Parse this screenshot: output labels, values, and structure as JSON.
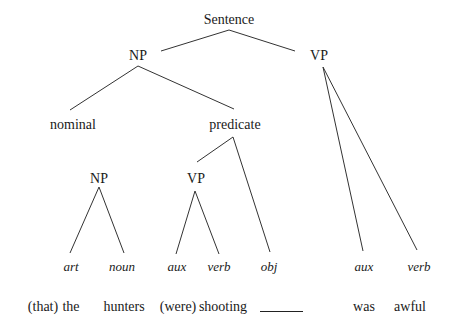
{
  "diagram": {
    "type": "syntax-tree",
    "root": {
      "label": "Sentence",
      "x": 229,
      "y": 12
    },
    "nodes": [
      {
        "id": "s",
        "label": "Sentence",
        "x": 229,
        "y": 12,
        "italic": false
      },
      {
        "id": "np1",
        "label": "NP",
        "x": 138,
        "y": 48,
        "italic": false
      },
      {
        "id": "vp1",
        "label": "VP",
        "x": 319,
        "y": 48,
        "italic": false
      },
      {
        "id": "nominal",
        "label": "nominal",
        "x": 73,
        "y": 117,
        "italic": false
      },
      {
        "id": "predicate",
        "label": "predicate",
        "x": 235,
        "y": 117,
        "italic": false
      },
      {
        "id": "np2",
        "label": "NP",
        "x": 99,
        "y": 171,
        "italic": false
      },
      {
        "id": "vp2",
        "label": "VP",
        "x": 196,
        "y": 171,
        "italic": false
      },
      {
        "id": "art",
        "label": "art",
        "x": 71,
        "y": 259,
        "italic": true
      },
      {
        "id": "noun",
        "label": "noun",
        "x": 122,
        "y": 259,
        "italic": true
      },
      {
        "id": "aux1",
        "label": "aux",
        "x": 177,
        "y": 259,
        "italic": true
      },
      {
        "id": "verb1",
        "label": "verb",
        "x": 219,
        "y": 259,
        "italic": true
      },
      {
        "id": "obj",
        "label": "obj",
        "x": 269,
        "y": 259,
        "italic": true
      },
      {
        "id": "aux2",
        "label": "aux",
        "x": 364,
        "y": 259,
        "italic": true
      },
      {
        "id": "verb2",
        "label": "verb",
        "x": 419,
        "y": 259,
        "italic": true
      }
    ],
    "edges": [
      {
        "from": "s",
        "to": "np1",
        "x1": 229,
        "y1": 30,
        "x2": 161,
        "y2": 51
      },
      {
        "from": "s",
        "to": "vp1",
        "x1": 229,
        "y1": 30,
        "x2": 295,
        "y2": 51
      },
      {
        "from": "np1",
        "to": "nominal",
        "x1": 138,
        "y1": 66,
        "x2": 70,
        "y2": 110
      },
      {
        "from": "np1",
        "to": "predicate",
        "x1": 138,
        "y1": 66,
        "x2": 234,
        "y2": 109
      },
      {
        "from": "vp1",
        "to": "aux2",
        "x1": 323,
        "y1": 67,
        "x2": 363,
        "y2": 251
      },
      {
        "from": "vp1",
        "to": "verb2",
        "x1": 323,
        "y1": 67,
        "x2": 417,
        "y2": 250
      },
      {
        "from": "predicate",
        "to": "vp2",
        "x1": 233,
        "y1": 137,
        "x2": 197,
        "y2": 162
      },
      {
        "from": "predicate",
        "to": "obj",
        "x1": 233,
        "y1": 137,
        "x2": 270,
        "y2": 252
      },
      {
        "from": "np2",
        "to": "art",
        "x1": 99,
        "y1": 187,
        "x2": 70,
        "y2": 253
      },
      {
        "from": "np2",
        "to": "noun",
        "x1": 99,
        "y1": 187,
        "x2": 124,
        "y2": 253
      },
      {
        "from": "vp2",
        "to": "aux1",
        "x1": 195,
        "y1": 191,
        "x2": 176,
        "y2": 254
      },
      {
        "from": "vp2",
        "to": "verb1",
        "x1": 195,
        "y1": 191,
        "x2": 219,
        "y2": 254
      }
    ],
    "words": [
      {
        "label": "(that)",
        "x": 43,
        "y": 299
      },
      {
        "label": "the",
        "x": 71,
        "y": 299
      },
      {
        "label": "hunters",
        "x": 124,
        "y": 299
      },
      {
        "label": "(were)",
        "x": 178,
        "y": 299
      },
      {
        "label": "shooting",
        "x": 223,
        "y": 299
      },
      {
        "label": "was",
        "x": 364,
        "y": 299
      },
      {
        "label": "awful",
        "x": 410,
        "y": 299
      }
    ],
    "gap_blank": {
      "x1": 260,
      "x2": 303,
      "y": 311,
      "meaning": "object gap"
    }
  }
}
